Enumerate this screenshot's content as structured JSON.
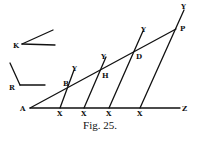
{
  "caption": "Fig. 25.",
  "labels": {
    "A": "A",
    "Z": "Z",
    "P": "P",
    "D": "D",
    "H": "H",
    "B": "B",
    "K": "K",
    "R": "R",
    "Y1": "Y",
    "Y2": "Y",
    "Y3": "Y",
    "Y4": "Y",
    "X1": "X",
    "X2": "X",
    "X3": "X",
    "X4": "X"
  },
  "diagram": {
    "type": "geometric-construction",
    "points": {
      "A": [
        30,
        108
      ],
      "Z": [
        185,
        108
      ],
      "P": [
        176,
        29
      ],
      "D": [
        137,
        50
      ],
      "H": [
        101,
        69
      ],
      "B": [
        68,
        86
      ],
      "X1": [
        60,
        108
      ],
      "X2": [
        84,
        108
      ],
      "X3": [
        109,
        108
      ],
      "X4": [
        140,
        108
      ]
    },
    "stroke_color": "#111111",
    "background": "#ffffff"
  }
}
